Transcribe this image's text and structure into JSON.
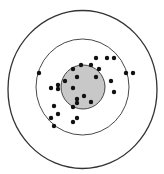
{
  "diagram": {
    "type": "target-scatter",
    "colors": {
      "ring_stroke": "#333333",
      "bullseye_fill": "#c8c8c8",
      "dot_fill": "#111111",
      "background": "#ffffff"
    },
    "rings": [
      {
        "name": "outer-ring",
        "cx": 82.5,
        "cy": 89.5,
        "rx": 74.5,
        "ry": 79
      },
      {
        "name": "middle-ring",
        "cx": 82.5,
        "cy": 87,
        "rx": 46.5,
        "ry": 48
      },
      {
        "name": "bullseye",
        "cx": 83,
        "cy": 87,
        "rx": 22,
        "ry": 22
      }
    ],
    "dots": [
      [
        96,
        58
      ],
      [
        107,
        58
      ],
      [
        114,
        58
      ],
      [
        81,
        65
      ],
      [
        91,
        65
      ],
      [
        73,
        69
      ],
      [
        99,
        69
      ],
      [
        39,
        73
      ],
      [
        126,
        73
      ],
      [
        133,
        73
      ],
      [
        77,
        77
      ],
      [
        96,
        77
      ],
      [
        65,
        81
      ],
      [
        111,
        81
      ],
      [
        58,
        85
      ],
      [
        51,
        88
      ],
      [
        58,
        89
      ],
      [
        73,
        88
      ],
      [
        114,
        92
      ],
      [
        84,
        96
      ],
      [
        77,
        99
      ],
      [
        77,
        103
      ],
      [
        91,
        102
      ],
      [
        54,
        106
      ],
      [
        73,
        107
      ],
      [
        58,
        114
      ],
      [
        51,
        118
      ],
      [
        77,
        118
      ],
      [
        73,
        122
      ],
      [
        54,
        126
      ]
    ],
    "dot_radius": 2.2
  }
}
